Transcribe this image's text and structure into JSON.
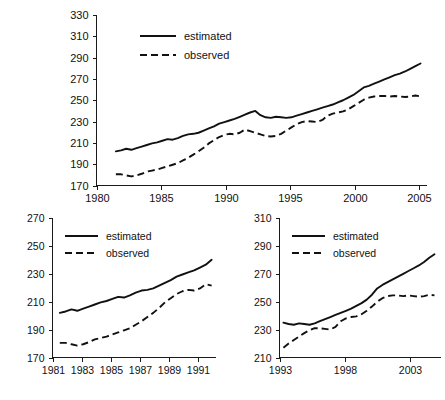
{
  "figure": {
    "background": "#ffffff",
    "line_color": "#111111",
    "panel_count": 3
  },
  "chart_data": [
    {
      "id": "full-period",
      "type": "line",
      "title": "",
      "xlabel": "",
      "ylabel": "",
      "xlim": [
        1980,
        2005.6
      ],
      "ylim": [
        170,
        330
      ],
      "xticks": [
        1980,
        1985,
        1990,
        1995,
        2000,
        2005
      ],
      "xtick_labels": [
        "1980",
        "1985",
        "1990",
        "1995",
        "2000",
        "2005"
      ],
      "yticks": [
        170,
        190,
        210,
        230,
        250,
        270,
        290,
        310,
        330
      ],
      "ytick_labels": [
        "170",
        "190",
        "210",
        "230",
        "250",
        "270",
        "290",
        "310",
        "330"
      ],
      "grid": false,
      "legend_position": "upper-left",
      "legend": [
        "estimated",
        "observed"
      ],
      "x": [
        1981.5,
        1981.9,
        1982.3,
        1982.7,
        1983.1,
        1983.5,
        1983.9,
        1984.3,
        1984.7,
        1985.1,
        1985.5,
        1985.9,
        1986.3,
        1986.7,
        1987.1,
        1987.5,
        1987.9,
        1988.3,
        1988.7,
        1989.1,
        1989.5,
        1989.9,
        1990.3,
        1990.7,
        1991.1,
        1991.5,
        1991.9,
        1992.3,
        1992.7,
        1993.1,
        1993.5,
        1993.9,
        1994.3,
        1994.7,
        1995.1,
        1995.5,
        1995.9,
        1996.3,
        1996.7,
        1997.1,
        1997.5,
        1997.9,
        1998.3,
        1998.7,
        1999.1,
        1999.5,
        1999.9,
        2000.3,
        2000.7,
        2001.1,
        2001.5,
        2001.9,
        2002.3,
        2002.7,
        2003.1,
        2003.5,
        2003.9,
        2004.3,
        2004.7,
        2005.1
      ],
      "series": [
        {
          "name": "estimated",
          "style": "solid",
          "values": [
            202,
            203,
            204.5,
            203.5,
            205,
            206.5,
            208,
            209.5,
            210.5,
            212,
            213.5,
            213,
            214.5,
            216.5,
            218,
            218.5,
            219.5,
            221.5,
            223.5,
            225.5,
            228,
            229.5,
            231,
            232.5,
            234.5,
            236.5,
            238.5,
            240,
            236,
            234,
            233.5,
            234.5,
            234,
            233.5,
            234,
            235.5,
            237,
            238.5,
            240,
            241.5,
            243,
            244.5,
            246,
            248,
            250,
            252.5,
            255,
            258.5,
            262,
            263.5,
            265.5,
            267.5,
            269.5,
            271.5,
            273.5,
            275,
            277,
            279.5,
            282,
            284.5
          ]
        },
        {
          "name": "observed",
          "style": "dashed",
          "values": [
            180.5,
            180.5,
            179.5,
            178.5,
            179.5,
            181,
            183,
            184,
            185,
            186.5,
            188,
            189.5,
            191,
            193.5,
            196,
            199,
            202,
            205.5,
            209.5,
            212.5,
            215.5,
            217.5,
            218.5,
            218,
            219.5,
            222.5,
            221,
            219.5,
            218,
            216.5,
            216,
            216.5,
            218.5,
            221.5,
            224.5,
            227.5,
            229.5,
            230.5,
            230,
            229.5,
            231.5,
            235.5,
            237.5,
            238.5,
            239.5,
            241.5,
            244.5,
            247.5,
            250.5,
            252.5,
            253.5,
            254,
            254,
            253.5,
            254,
            253.5,
            253,
            253.5,
            254.5,
            253.5
          ]
        }
      ]
    },
    {
      "id": "early-period",
      "type": "line",
      "title": "",
      "xlabel": "",
      "ylabel": "",
      "xlim": [
        1981,
        1992.2
      ],
      "ylim": [
        170,
        270
      ],
      "xticks": [
        1981,
        1983,
        1985,
        1987,
        1989,
        1991
      ],
      "xtick_labels": [
        "1981",
        "1983",
        "1985",
        "1987",
        "1989",
        "1991"
      ],
      "yticks": [
        170,
        190,
        210,
        230,
        250,
        270
      ],
      "ytick_labels": [
        "170",
        "190",
        "210",
        "230",
        "250",
        "270"
      ],
      "grid": false,
      "legend_position": "upper-left",
      "legend": [
        "estimated",
        "observed"
      ],
      "x": [
        1981.5,
        1981.9,
        1982.3,
        1982.7,
        1983.1,
        1983.5,
        1983.9,
        1984.3,
        1984.7,
        1985.1,
        1985.5,
        1985.9,
        1986.3,
        1986.7,
        1987.1,
        1987.5,
        1987.9,
        1988.3,
        1988.7,
        1989.1,
        1989.5,
        1989.9,
        1990.3,
        1990.7,
        1991.1,
        1991.5,
        1991.9
      ],
      "series": [
        {
          "name": "estimated",
          "style": "solid",
          "values": [
            202,
            203,
            204.5,
            203.5,
            205,
            206.5,
            208,
            209.5,
            210.5,
            212,
            213.5,
            213,
            214.5,
            216.5,
            218,
            218.5,
            219.5,
            221.5,
            223.5,
            225.5,
            228,
            229.5,
            231,
            232.5,
            234.5,
            236.5,
            240
          ]
        },
        {
          "name": "observed",
          "style": "dashed",
          "values": [
            180.5,
            180.5,
            179.5,
            178.5,
            179.5,
            181,
            183,
            184,
            185,
            186.5,
            188,
            189.5,
            191,
            193.5,
            196,
            199,
            202,
            205.5,
            209.5,
            212.5,
            215.5,
            217.5,
            218.5,
            218,
            219.5,
            222.5,
            221.5
          ]
        }
      ]
    },
    {
      "id": "late-period",
      "type": "line",
      "title": "",
      "xlabel": "",
      "ylabel": "",
      "xlim": [
        1993,
        2005.4
      ],
      "ylim": [
        210,
        310
      ],
      "xticks": [
        1993,
        1998,
        2003
      ],
      "xtick_labels": [
        "1993",
        "1998",
        "2003"
      ],
      "yticks": [
        210,
        230,
        250,
        270,
        290,
        310
      ],
      "ytick_labels": [
        "210",
        "230",
        "250",
        "270",
        "290",
        "310"
      ],
      "grid": false,
      "legend_position": "upper-left",
      "legend": [
        "estimated",
        "observed"
      ],
      "x": [
        1993.3,
        1993.7,
        1994.1,
        1994.5,
        1994.9,
        1995.3,
        1995.7,
        1996.1,
        1996.5,
        1996.9,
        1997.3,
        1997.7,
        1998.1,
        1998.5,
        1998.9,
        1999.3,
        1999.7,
        2000.1,
        2000.5,
        2000.9,
        2001.3,
        2001.7,
        2002.1,
        2002.5,
        2002.9,
        2003.3,
        2003.7,
        2004.1,
        2004.5,
        2004.9
      ],
      "series": [
        {
          "name": "estimated",
          "style": "solid",
          "values": [
            235,
            234,
            233.5,
            234.5,
            234,
            233.5,
            234.5,
            236,
            237.5,
            239,
            240.5,
            242,
            243.5,
            245,
            247,
            249,
            251.5,
            255,
            259.5,
            262,
            264,
            266,
            268,
            270,
            272,
            274,
            276,
            278.5,
            281.5,
            284
          ]
        },
        {
          "name": "observed",
          "style": "dashed",
          "values": [
            217,
            220,
            222.5,
            225,
            227.5,
            229.5,
            231,
            231,
            230.5,
            230,
            232,
            236,
            238,
            239,
            239.5,
            241,
            243.5,
            246.5,
            250,
            252.5,
            254,
            254.5,
            254.5,
            254,
            254.5,
            254,
            253.5,
            254,
            255,
            254.5
          ]
        }
      ]
    }
  ]
}
